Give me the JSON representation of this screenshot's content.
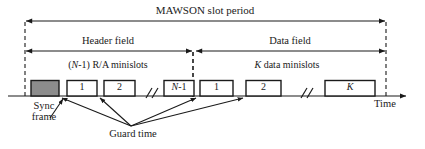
{
  "figure": {
    "type": "timing-diagram",
    "title": "MAWSON slot period",
    "axis_label": "Time"
  },
  "spans": {
    "total": {
      "label": "MAWSON slot period",
      "x1": 25,
      "x2": 386,
      "y": 21
    },
    "header": {
      "label": "Header field",
      "x1": 25,
      "x2": 192,
      "y": 51
    },
    "data": {
      "label": "Data field",
      "x1": 196,
      "x2": 386,
      "y": 51
    }
  },
  "group_labels": [
    {
      "id": "ra-minislots",
      "prefix": "(",
      "italic": "N",
      "suffix": "-1) R/A minislots",
      "cx": 108,
      "y": 61
    },
    {
      "id": "data-minislots",
      "italic": "K",
      "suffix": " data minislots",
      "cx": 287,
      "y": 61
    }
  ],
  "slots": [
    {
      "id": "sync-frame",
      "label": "",
      "x": 31,
      "w": 28,
      "filled": true
    },
    {
      "id": "ra-1",
      "label": "1",
      "x": 67,
      "w": 30,
      "filled": false
    },
    {
      "id": "ra-2",
      "label": "2",
      "x": 104,
      "w": 31,
      "filled": false
    },
    {
      "id": "ra-n-1",
      "label": "N-1",
      "x": 164,
      "w": 30,
      "filled": false,
      "italic_first": true
    },
    {
      "id": "data-1",
      "label": "1",
      "x": 200,
      "w": 33,
      "filled": false
    },
    {
      "id": "data-2",
      "label": "2",
      "x": 246,
      "w": 35,
      "filled": false
    },
    {
      "id": "data-k",
      "label": "K",
      "x": 325,
      "w": 50,
      "filled": false,
      "italic": true
    }
  ],
  "breaks": [
    {
      "id": "break-header",
      "x": 148
    },
    {
      "id": "break-data",
      "x": 303
    }
  ],
  "dashed_lines": [
    {
      "id": "dash-start",
      "x": 25,
      "y1": 22,
      "y2": 96
    },
    {
      "id": "dash-middle",
      "x": 193,
      "y1": 52,
      "y2": 96
    },
    {
      "id": "dash-end",
      "x": 386,
      "y1": 22,
      "y2": 96
    }
  ],
  "callouts": [
    {
      "id": "sync-frame-caption",
      "line1": "Sync",
      "line2": "frame",
      "cx": 44,
      "y": 103
    },
    {
      "id": "guard-time-caption",
      "label": "Guard time",
      "cx": 133,
      "y": 132
    }
  ],
  "guard_arrow_targets": [
    {
      "id": "guard-target-sync",
      "x": 61,
      "y": 97
    },
    {
      "id": "guard-target-ra1",
      "x": 99,
      "y": 97
    },
    {
      "id": "guard-target-mid",
      "x": 197,
      "y": 97
    },
    {
      "id": "guard-target-data1",
      "x": 243,
      "y": 97
    }
  ],
  "guard_arrow_origin": {
    "x": 131,
    "y": 126
  },
  "baseline": {
    "y": 96,
    "x1": 8,
    "x2": 410
  },
  "colors": {
    "stroke": "#1a1a1a",
    "sync_fill": "#8c8c8c",
    "box_fill": "#ffffff",
    "background": "#ffffff"
  }
}
